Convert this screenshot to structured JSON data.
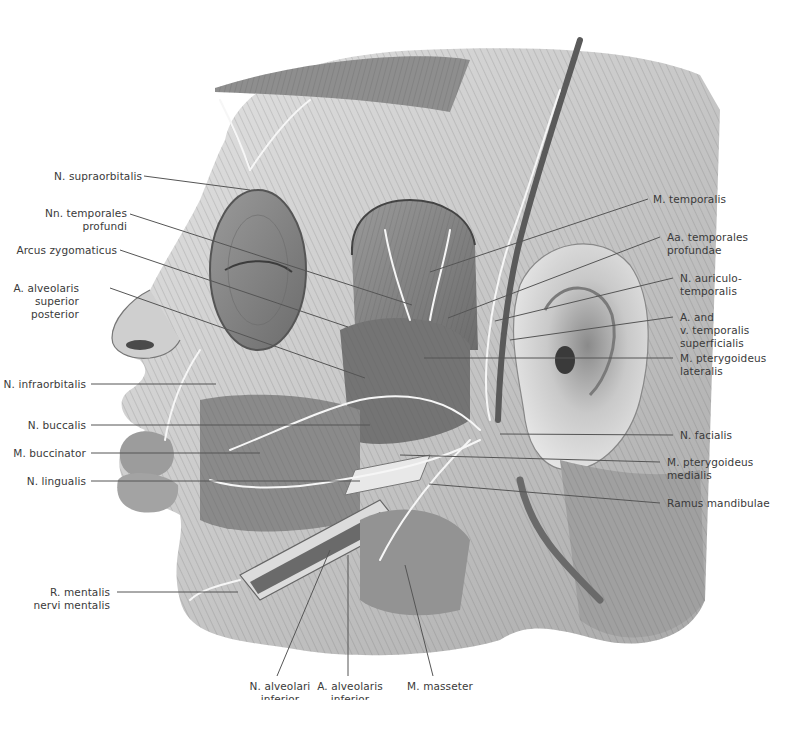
{
  "figure": {
    "palette": {
      "background": "#ffffff",
      "skin_light": "#dcdcdc",
      "skin_mid": "#b4b4b4",
      "muscle_dark": "#7a7a7a",
      "nerve": "#f2f2f2",
      "vessel": "#6e6e6e",
      "leader": "#555555",
      "text": "#3a3a3a"
    }
  },
  "labels": {
    "left": [
      {
        "id": "n-supraorbitalis",
        "lines": [
          "N. supraorbitalis"
        ]
      },
      {
        "id": "nn-temporales-profundi",
        "lines": [
          "Nn. temporales",
          "profundi"
        ]
      },
      {
        "id": "arcus-zygomaticus",
        "lines": [
          "Arcus zygomaticus"
        ]
      },
      {
        "id": "a-alveolaris-superior-posterior",
        "lines": [
          "A. alveolaris",
          "superior",
          "posterior"
        ]
      },
      {
        "id": "n-infraorbitalis",
        "lines": [
          "N. infraorbitalis"
        ]
      },
      {
        "id": "n-buccalis",
        "lines": [
          "N. buccalis"
        ]
      },
      {
        "id": "m-buccinator",
        "lines": [
          "M. buccinator"
        ]
      },
      {
        "id": "n-lingualis",
        "lines": [
          "N. lingualis"
        ]
      },
      {
        "id": "r-mentalis",
        "lines": [
          "R. mentalis",
          "nervi mentalis"
        ]
      }
    ],
    "right": [
      {
        "id": "m-temporalis",
        "lines": [
          "M. temporalis"
        ]
      },
      {
        "id": "aa-temporales-profundae",
        "lines": [
          "Aa. temporales",
          "profundae"
        ]
      },
      {
        "id": "n-auriculotemporalis",
        "lines": [
          "N. auriculo-",
          "temporalis"
        ]
      },
      {
        "id": "a-v-temporalis-superficialis",
        "lines": [
          "A. and",
          "v. temporalis",
          "superficialis"
        ]
      },
      {
        "id": "m-pterygoideus-lateralis",
        "lines": [
          "M. pterygoideus",
          "lateralis"
        ]
      },
      {
        "id": "n-facialis",
        "lines": [
          "N. facialis"
        ]
      },
      {
        "id": "m-pterygoideus-medialis",
        "lines": [
          "M. pterygoideus",
          "medialis"
        ]
      },
      {
        "id": "ramus-mandibulae",
        "lines": [
          "Ramus mandibulae"
        ]
      }
    ],
    "bottom": [
      {
        "id": "n-alveolaris-inferior",
        "lines": [
          "N. alveolari",
          "inferior"
        ]
      },
      {
        "id": "a-alveolaris-inferior",
        "lines": [
          "A. alveolaris",
          "inferior"
        ]
      },
      {
        "id": "m-masseter",
        "lines": [
          "M. masseter"
        ]
      }
    ]
  }
}
